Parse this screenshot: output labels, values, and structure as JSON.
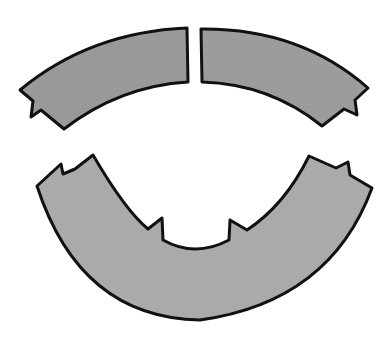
{
  "illustration": {
    "description": "Three gray arc-shaped puzzle pieces: two small arcs on top, one large U-shaped arc below",
    "colors": {
      "background": "#ffffff",
      "piece_fill": "#9a9a9a",
      "piece_fill_light": "#acacac",
      "outline": "#111111"
    },
    "pieces": [
      {
        "name": "top-left-arc-piece"
      },
      {
        "name": "top-right-arc-piece"
      },
      {
        "name": "bottom-u-arc-piece"
      }
    ]
  }
}
